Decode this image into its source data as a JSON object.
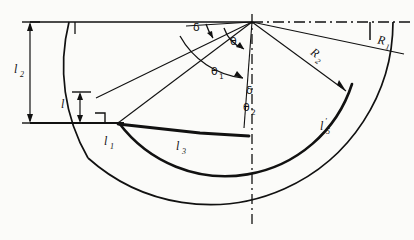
{
  "figure": {
    "background_color": "#fbfbf9",
    "line_color": "#111111",
    "canvas": {
      "width": 414,
      "height": 240
    }
  },
  "labels": {
    "l2": {
      "text": "l",
      "sub": "2",
      "x": 18,
      "y": 68
    },
    "l": {
      "text": "l",
      "sub": "",
      "x": 62,
      "y": 104
    },
    "l1": {
      "text": "l",
      "sub": "1",
      "x": 108,
      "y": 145
    },
    "l3": {
      "text": "l",
      "sub": "3",
      "x": 180,
      "y": 147
    },
    "l5": {
      "text": "l",
      "sub": "5",
      "prime": "'",
      "x": 322,
      "y": 130
    },
    "R1": {
      "text": "R",
      "sub": "1",
      "x": 381,
      "y": 44
    },
    "R2": {
      "text": "R",
      "sub": "2",
      "x": 313,
      "y": 56
    }
  },
  "angles": {
    "delta_top": {
      "symbol": "δ",
      "sub": "",
      "x": 196,
      "y": 28
    },
    "theta": {
      "symbol": "θ",
      "sub": "",
      "x": 233,
      "y": 42
    },
    "theta1": {
      "symbol": "θ",
      "sub": "1",
      "x": 216,
      "y": 72
    },
    "delta_inner": {
      "symbol": "δ",
      "sub": "",
      "x": 249,
      "y": 91
    },
    "theta2": {
      "symbol": "θ",
      "sub": "2",
      "x": 247,
      "y": 108
    }
  },
  "geometry": {
    "center": {
      "x": 252,
      "y": 22
    },
    "junction_l1": {
      "x": 118,
      "y": 123
    },
    "baseline_y": 123,
    "top_axis_y": 22,
    "outer_radius": 183,
    "inner_radius": 133,
    "dim_line_x": 30,
    "dim_small_x": 75,
    "right_tick_x": 370
  },
  "elements": {
    "horizontal_axis": "dash-dot centerline",
    "vertical_axis": "dash-dot centerline",
    "outer_arc": "R1 arc",
    "inner_arc": "R2 arc",
    "right_angle_marker": "perpendicular symbol at l1 junction"
  }
}
